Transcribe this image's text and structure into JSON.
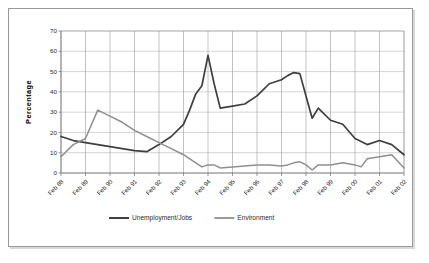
{
  "chart_data": {
    "type": "line",
    "title": "",
    "xlabel": "",
    "ylabel": "Percentage",
    "ylim": [
      0,
      70
    ],
    "ytick_step": 10,
    "yticks": [
      "0",
      "10",
      "20",
      "30",
      "40",
      "50",
      "60",
      "70"
    ],
    "grid": true,
    "legend_position": "bottom",
    "categories": [
      "Feb 88",
      "Feb 89",
      "Feb 90",
      "Feb 91",
      "Feb 92",
      "Feb 93",
      "Feb 94",
      "Feb 95",
      "Feb 96",
      "Feb 97",
      "Feb 98",
      "Feb 99",
      "Feb 00",
      "Feb 01",
      "Feb 02"
    ],
    "series": [
      {
        "name": "Unemployment/Jobs",
        "color": "#3f3f3f",
        "x": [
          0,
          0.5,
          1,
          1.5,
          2,
          2.5,
          3,
          3.5,
          4,
          4.5,
          5,
          5.25,
          5.5,
          5.75,
          6,
          6.25,
          6.5,
          7,
          7.5,
          8,
          8.5,
          9,
          9.25,
          9.5,
          9.75,
          10,
          10.25,
          10.5,
          11,
          11.5,
          12,
          12.5,
          13,
          13.5,
          14
        ],
        "values": [
          18,
          16,
          15,
          14,
          13,
          12,
          11,
          10.5,
          14,
          18,
          24,
          31,
          39,
          43,
          58,
          44,
          32,
          33,
          34,
          38,
          44,
          46,
          48,
          49.5,
          49,
          38,
          27,
          32,
          26,
          24,
          17,
          14,
          16,
          14,
          9
        ]
      },
      {
        "name": "Environment",
        "color": "#8f8f8f",
        "x": [
          0,
          0.5,
          1,
          1.5,
          2,
          2.5,
          3,
          3.5,
          4,
          4.5,
          5,
          5.5,
          5.75,
          6,
          6.25,
          6.5,
          7,
          7.5,
          8,
          8.5,
          9,
          9.25,
          9.5,
          9.75,
          10,
          10.25,
          10.5,
          11,
          11.5,
          12,
          12.25,
          12.5,
          13,
          13.5,
          14
        ],
        "values": [
          8,
          14,
          17,
          31,
          28,
          25,
          21,
          18,
          15,
          12,
          9,
          5,
          3,
          4,
          4,
          2.5,
          3,
          3.5,
          4,
          4,
          3.5,
          4,
          5,
          5.5,
          4,
          1.5,
          4,
          4,
          5,
          4,
          3,
          7,
          8,
          9,
          2.5
        ]
      }
    ]
  },
  "legend": {
    "items": [
      {
        "label": "Unemployment/Jobs",
        "color": "#3f3f3f"
      },
      {
        "label": "Environment",
        "color": "#8f8f8f"
      }
    ]
  },
  "axis": {
    "y_title": "Percentage"
  }
}
